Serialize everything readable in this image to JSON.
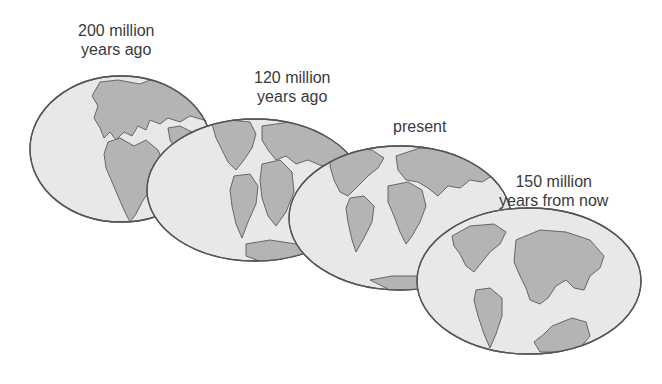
{
  "figure": {
    "type": "continental-drift-sequence",
    "stages": [
      {
        "label": "200 million\nyears ago",
        "line1": "200 million",
        "line2": "years ago"
      },
      {
        "label": "120 million\nyears ago",
        "line1": "120 million",
        "line2": "years ago"
      },
      {
        "label": "present",
        "line1": "present"
      },
      {
        "label": "150 million\nyears from now",
        "line1": "150 million",
        "line2": "years from now"
      }
    ]
  },
  "colors": {
    "ocean": "#e8e8e8",
    "land": "#b4b4b4",
    "outline": "#555555",
    "text": "#3a3a3a"
  }
}
